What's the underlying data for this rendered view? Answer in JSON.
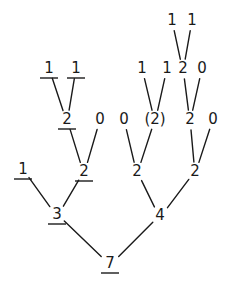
{
  "diagram": {
    "type": "tree",
    "nodes": [
      {
        "id": "n7",
        "label": "7",
        "x": 110,
        "y": 268,
        "underlined": true
      },
      {
        "id": "n3",
        "label": "3",
        "x": 57,
        "y": 219,
        "underlined": true
      },
      {
        "id": "n4",
        "label": "4",
        "x": 160,
        "y": 220,
        "underlined": false
      },
      {
        "id": "n1a",
        "label": "1",
        "x": 23,
        "y": 174,
        "underlined": true
      },
      {
        "id": "n2a",
        "label": "2",
        "x": 84,
        "y": 176,
        "underlined": true
      },
      {
        "id": "n2b",
        "label": "2",
        "x": 137,
        "y": 176,
        "underlined": false
      },
      {
        "id": "n2c",
        "label": "2",
        "x": 195,
        "y": 176,
        "underlined": false
      },
      {
        "id": "n2d",
        "label": "2",
        "x": 67,
        "y": 124,
        "underlined": true
      },
      {
        "id": "n0a",
        "label": "0",
        "x": 100,
        "y": 124,
        "underlined": false
      },
      {
        "id": "n0b",
        "label": "0",
        "x": 124,
        "y": 124,
        "underlined": false
      },
      {
        "id": "n2e",
        "label": "(2)",
        "x": 155,
        "y": 124,
        "underlined": false
      },
      {
        "id": "n2f",
        "label": "2",
        "x": 190,
        "y": 124,
        "underlined": false
      },
      {
        "id": "n0c",
        "label": "0",
        "x": 213,
        "y": 124,
        "underlined": false
      },
      {
        "id": "n1b",
        "label": "1",
        "x": 49,
        "y": 73,
        "underlined": true
      },
      {
        "id": "n1c",
        "label": "1",
        "x": 76,
        "y": 73,
        "underlined": true
      },
      {
        "id": "n1d",
        "label": "1",
        "x": 142,
        "y": 73,
        "underlined": false
      },
      {
        "id": "n1e",
        "label": "1",
        "x": 167,
        "y": 73,
        "underlined": false
      },
      {
        "id": "n2g",
        "label": "2",
        "x": 183,
        "y": 73,
        "underlined": false
      },
      {
        "id": "n0d",
        "label": "0",
        "x": 202,
        "y": 73,
        "underlined": false
      },
      {
        "id": "n1f",
        "label": "1",
        "x": 172,
        "y": 25,
        "underlined": false
      },
      {
        "id": "n1g",
        "label": "1",
        "x": 192,
        "y": 25,
        "underlined": false
      }
    ],
    "edges": [
      [
        "n7",
        "n3"
      ],
      [
        "n7",
        "n4"
      ],
      [
        "n3",
        "n1a"
      ],
      [
        "n3",
        "n2a"
      ],
      [
        "n4",
        "n2b"
      ],
      [
        "n4",
        "n2c"
      ],
      [
        "n2a",
        "n2d"
      ],
      [
        "n2a",
        "n0a"
      ],
      [
        "n2b",
        "n0b"
      ],
      [
        "n2b",
        "n2e"
      ],
      [
        "n2c",
        "n2f"
      ],
      [
        "n2c",
        "n0c"
      ],
      [
        "n2d",
        "n1b"
      ],
      [
        "n2d",
        "n1c"
      ],
      [
        "n2e",
        "n1d"
      ],
      [
        "n2e",
        "n1e"
      ],
      [
        "n2f",
        "n2g"
      ],
      [
        "n2f",
        "n0d"
      ],
      [
        "n2g",
        "n1f"
      ],
      [
        "n2g",
        "n1g"
      ]
    ]
  }
}
